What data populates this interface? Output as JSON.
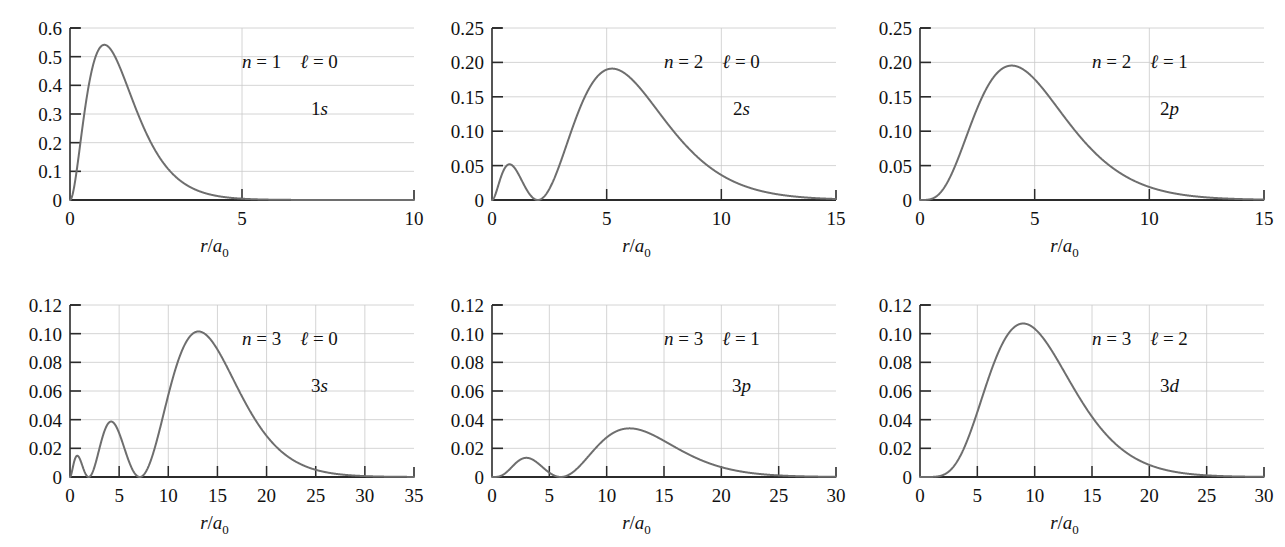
{
  "figure": {
    "title": "",
    "colors": {
      "curve": "#6e6e6e",
      "axis": "#2b2b2b",
      "grid": "#c9c9c9",
      "text": "#111111",
      "background": "#ffffff"
    },
    "axis_label": {
      "numerator": "r",
      "slash": "/",
      "denominator": "a",
      "subscript": "0"
    }
  },
  "chart_data": [
    {
      "id": "1s",
      "type": "line",
      "title": "",
      "xlabel": "r/a0",
      "ylabel": "",
      "xlim": [
        0,
        10
      ],
      "ylim": [
        0,
        0.6
      ],
      "xticks": [
        0,
        5,
        10
      ],
      "xtick_labels": [
        "0",
        "5",
        "10"
      ],
      "xticks_minor": [
        1,
        2,
        3,
        4,
        6,
        7,
        8,
        9
      ],
      "yticks": [
        0,
        0.1,
        0.2,
        0.3,
        0.4,
        0.5,
        0.6
      ],
      "ytick_labels": [
        "0",
        "0.1",
        "0.2",
        "0.3",
        "0.4",
        "0.5",
        "0.6"
      ],
      "grid": true,
      "annotations": {
        "n_label": "n",
        "n_value": "1",
        "l_label": "ℓ",
        "l_value": "0",
        "orbital": "1s"
      },
      "peak": {
        "x": 1.0,
        "y": 0.5413
      },
      "formula": "4*x^2*exp(-2x)",
      "series": [
        {
          "name": "1s radial probability",
          "color": "#6e6e6e"
        }
      ]
    },
    {
      "id": "2s",
      "type": "line",
      "title": "",
      "xlabel": "r/a0",
      "ylabel": "",
      "xlim": [
        0,
        15
      ],
      "ylim": [
        0,
        0.25
      ],
      "xticks": [
        0,
        5,
        10,
        15
      ],
      "xtick_labels": [
        "0",
        "5",
        "10",
        "15"
      ],
      "xticks_minor": [],
      "yticks": [
        0,
        0.05,
        0.1,
        0.15,
        0.2,
        0.25
      ],
      "ytick_labels": [
        "0",
        "0.05",
        "0.10",
        "0.15",
        "0.20",
        "0.25"
      ],
      "grid": true,
      "annotations": {
        "n_label": "n",
        "n_value": "2",
        "l_label": "ℓ",
        "l_value": "0",
        "orbital": "2s"
      },
      "peak": {
        "x": 5.24,
        "y": 0.1919
      },
      "secondary_peak": {
        "x": 0.76,
        "y": 0.0518
      },
      "node": {
        "x": 2.0,
        "y": 0.0
      },
      "formula": "(1/8)*x^2*(2-x)^2*exp(-x)",
      "series": [
        {
          "name": "2s radial probability",
          "color": "#6e6e6e"
        }
      ]
    },
    {
      "id": "2p",
      "type": "line",
      "title": "",
      "xlabel": "r/a0",
      "ylabel": "",
      "xlim": [
        0,
        15
      ],
      "ylim": [
        0,
        0.25
      ],
      "xticks": [
        0,
        5,
        10,
        15
      ],
      "xtick_labels": [
        "0",
        "5",
        "10",
        "15"
      ],
      "xticks_minor": [],
      "yticks": [
        0,
        0.05,
        0.1,
        0.15,
        0.2,
        0.25
      ],
      "ytick_labels": [
        "0",
        "0.05",
        "0.10",
        "0.15",
        "0.20",
        "0.25"
      ],
      "grid": true,
      "annotations": {
        "n_label": "n",
        "n_value": "2",
        "l_label": "ℓ",
        "l_value": "1",
        "orbital": "2p"
      },
      "peak": {
        "x": 4.0,
        "y": 0.1954
      },
      "formula": "(1/24)*x^4*exp(-x)",
      "series": [
        {
          "name": "2p radial probability",
          "color": "#6e6e6e"
        }
      ]
    },
    {
      "id": "3s",
      "type": "line",
      "title": "",
      "xlabel": "r/a0",
      "ylabel": "",
      "xlim": [
        0,
        35
      ],
      "ylim": [
        0,
        0.12
      ],
      "xticks": [
        0,
        5,
        10,
        15,
        20,
        25,
        30,
        35
      ],
      "xtick_labels": [
        "0",
        "5",
        "10",
        "15",
        "20",
        "25",
        "30",
        "35"
      ],
      "xticks_minor": [],
      "yticks": [
        0,
        0.02,
        0.04,
        0.06,
        0.08,
        0.1,
        0.12
      ],
      "ytick_labels": [
        "0",
        "0.02",
        "0.04",
        "0.06",
        "0.08",
        "0.10",
        "0.12"
      ],
      "grid": true,
      "annotations": {
        "n_label": "n",
        "n_value": "3",
        "l_label": "ℓ",
        "l_value": "0",
        "orbital": "3s"
      },
      "peak": {
        "x": 13.07,
        "y": 0.1018
      },
      "secondary_peak": {
        "x": 4.2,
        "y": 0.0382
      },
      "tertiary_peak": {
        "x": 0.74,
        "y": 0.0133
      },
      "nodes": [
        1.9,
        7.1
      ],
      "formula": "(4/19683)*x^2*(27-18x+2x^2)^2*exp(-2x/3)",
      "series": [
        {
          "name": "3s radial probability",
          "color": "#6e6e6e"
        }
      ]
    },
    {
      "id": "3p",
      "type": "line",
      "title": "",
      "xlabel": "r/a0",
      "ylabel": "",
      "xlim": [
        0,
        30
      ],
      "ylim": [
        0,
        0.12
      ],
      "xticks": [
        0,
        5,
        10,
        15,
        20,
        25,
        30
      ],
      "xtick_labels": [
        "0",
        "5",
        "10",
        "15",
        "20",
        "25",
        "30"
      ],
      "xticks_minor": [],
      "yticks": [
        0,
        0.02,
        0.04,
        0.06,
        0.08,
        0.1,
        0.12
      ],
      "ytick_labels": [
        "0",
        "0.02",
        "0.04",
        "0.06",
        "0.08",
        "0.10",
        "0.12"
      ],
      "grid": true,
      "annotations": {
        "n_label": "n",
        "n_value": "3",
        "l_label": "ℓ",
        "l_value": "1",
        "orbital": "3p"
      },
      "peak": {
        "x": 12.0,
        "y": 0.1025
      },
      "secondary_peak": {
        "x": 3.3,
        "y": 0.0396
      },
      "node": {
        "x": 6.0,
        "y": 0.0
      },
      "formula": "(8/19683)*x^4*(6-x)^2*exp(-2x/3)/2",
      "series": [
        {
          "name": "3p radial probability",
          "color": "#6e6e6e"
        }
      ]
    },
    {
      "id": "3d",
      "type": "line",
      "title": "",
      "xlabel": "r/a0",
      "ylabel": "",
      "xlim": [
        0,
        30
      ],
      "ylim": [
        0,
        0.12
      ],
      "xticks": [
        0,
        5,
        10,
        15,
        20,
        25,
        30
      ],
      "xtick_labels": [
        "0",
        "5",
        "10",
        "15",
        "20",
        "25",
        "30"
      ],
      "xticks_minor": [],
      "yticks": [
        0,
        0.02,
        0.04,
        0.06,
        0.08,
        0.1,
        0.12
      ],
      "ytick_labels": [
        "0",
        "0.02",
        "0.04",
        "0.06",
        "0.08",
        "0.10",
        "0.12"
      ],
      "grid": true,
      "annotations": {
        "n_label": "n",
        "n_value": "3",
        "l_label": "ℓ",
        "l_value": "2",
        "orbital": "3d"
      },
      "peak": {
        "x": 9.0,
        "y": 0.1084
      },
      "formula": "(8/98415)*x^6*exp(-2x/3)",
      "series": [
        {
          "name": "3d radial probability",
          "color": "#6e6e6e"
        }
      ]
    }
  ],
  "layout": {
    "panels": [
      {
        "id": "1s",
        "left": 8,
        "top": 8,
        "width": 420,
        "height": 262
      },
      {
        "id": "2s",
        "left": 430,
        "top": 8,
        "width": 420,
        "height": 262
      },
      {
        "id": "2p",
        "left": 858,
        "top": 8,
        "width": 420,
        "height": 262
      },
      {
        "id": "3s",
        "left": 8,
        "top": 285,
        "width": 420,
        "height": 262
      },
      {
        "id": "3p",
        "left": 430,
        "top": 285,
        "width": 420,
        "height": 262
      },
      {
        "id": "3d",
        "left": 858,
        "top": 285,
        "width": 420,
        "height": 262
      }
    ]
  }
}
